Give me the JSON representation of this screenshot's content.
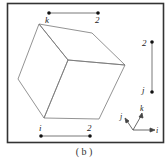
{
  "figure": {
    "caption": "( b )",
    "segments": [
      {
        "id": "top",
        "start_label": "k",
        "end_label": "2"
      },
      {
        "id": "right",
        "start_label": "2",
        "end_label": "j"
      },
      {
        "id": "bottom",
        "start_label": "i",
        "end_label": "2"
      }
    ],
    "axes": {
      "x_label": "i",
      "y_label": "j",
      "z_label": "k"
    },
    "colors": {
      "line": "#555555",
      "frame": "#333333",
      "dot": "#111111",
      "background": "#ffffff"
    }
  }
}
